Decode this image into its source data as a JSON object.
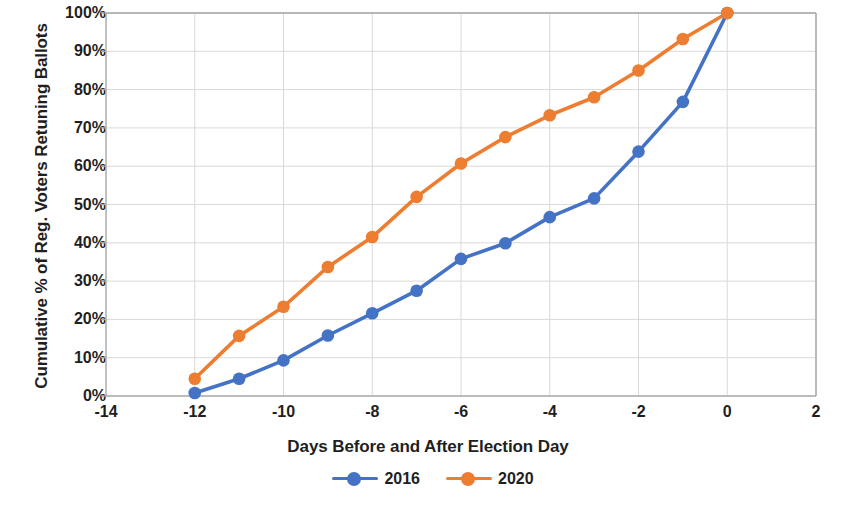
{
  "chart_data": {
    "type": "line",
    "title": "",
    "xlabel": "Days Before and After Election Day",
    "ylabel": "Cumulative % of Reg. Voters Retuning Ballots",
    "x": [
      -12,
      -11,
      -10,
      -9,
      -8,
      -7,
      -6,
      -5,
      -4,
      -3,
      -2,
      -1,
      0
    ],
    "xlim": [
      -14,
      2
    ],
    "ylim": [
      0,
      100
    ],
    "grid": true,
    "legend_position": "bottom",
    "x_ticks": [
      "-14",
      "-12",
      "-10",
      "-8",
      "-6",
      "-4",
      "-2",
      "0",
      "2"
    ],
    "x_tick_values": [
      -14,
      -12,
      -10,
      -8,
      -6,
      -4,
      -2,
      0,
      2
    ],
    "y_ticks": [
      "0%",
      "10%",
      "20%",
      "30%",
      "40%",
      "50%",
      "60%",
      "70%",
      "80%",
      "90%",
      "100%"
    ],
    "y_tick_values": [
      0,
      10,
      20,
      30,
      40,
      50,
      60,
      70,
      80,
      90,
      100
    ],
    "series": [
      {
        "name": "2016",
        "color": "#4472C4",
        "values": [
          0.8,
          4.5,
          9.3,
          15.8,
          21.6,
          27.5,
          35.8,
          39.9,
          46.7,
          51.6,
          63.8,
          76.8,
          100
        ]
      },
      {
        "name": "2020",
        "color": "#ED7D31",
        "values": [
          4.5,
          15.7,
          23.3,
          33.7,
          41.5,
          52.0,
          60.7,
          67.6,
          73.3,
          78.0,
          85.0,
          93.2,
          100
        ]
      }
    ]
  },
  "legend": {
    "items": [
      {
        "label": "2016",
        "color": "#4472C4"
      },
      {
        "label": "2020",
        "color": "#ED7D31"
      }
    ]
  },
  "style": {
    "axis_color": "#a6a6a6",
    "grid_color": "#d9d9d9",
    "plot_background": "#ffffff",
    "text_color": "#1f1f1f"
  }
}
